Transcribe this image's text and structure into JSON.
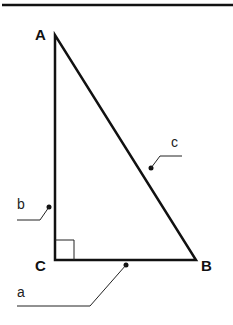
{
  "diagram": {
    "vertices": [
      {
        "label": "A",
        "x": 55,
        "y": 35
      },
      {
        "label": "B",
        "x": 196,
        "y": 260
      },
      {
        "label": "C",
        "x": 55,
        "y": 260
      }
    ],
    "sides": [
      {
        "label": "a",
        "between": "C-B"
      },
      {
        "label": "b",
        "between": "A-C"
      },
      {
        "label": "c",
        "between": "A-B"
      }
    ],
    "right_angle_at": "C",
    "colors": {
      "stroke": "#111111",
      "background": "#ffffff"
    }
  },
  "labels": {
    "A": "A",
    "B": "B",
    "C": "C",
    "a": "a",
    "b": "b",
    "c": "c"
  }
}
